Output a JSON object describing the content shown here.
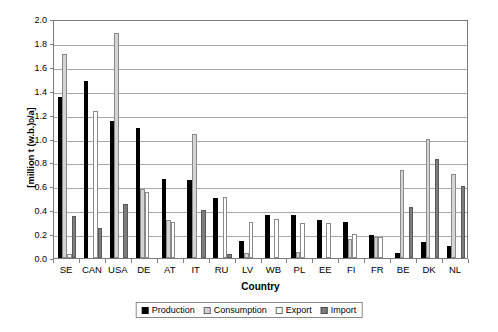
{
  "chart_data": {
    "type": "bar",
    "title": "",
    "xlabel": "Country",
    "ylabel": "[million t (w.b.)_D/a]",
    "ylabel_prefix": "[million t (w.b.)",
    "ylabel_subscript": "D",
    "ylabel_suffix": "/a]",
    "ylim": [
      0.0,
      2.0
    ],
    "ytick_step": 0.2,
    "grid": true,
    "legend_position": "bottom",
    "categories": [
      "SE",
      "CAN",
      "USA",
      "DE",
      "AT",
      "IT",
      "RU",
      "LV",
      "WB",
      "PL",
      "EE",
      "FI",
      "FR",
      "BE",
      "DK",
      "NL"
    ],
    "ytick_labels": [
      "0.0",
      "0.2",
      "0.4",
      "0.6",
      "0.8",
      "1.0",
      "1.2",
      "1.4",
      "1.6",
      "1.8",
      "2.0"
    ],
    "ytick_values": [
      0.0,
      0.2,
      0.4,
      0.6,
      0.8,
      1.0,
      1.2,
      1.4,
      1.6,
      1.8,
      2.0
    ],
    "series": [
      {
        "name": "Production",
        "color": "#000000",
        "values": [
          1.35,
          1.48,
          1.15,
          1.09,
          0.66,
          0.65,
          0.5,
          0.14,
          0.36,
          0.36,
          0.32,
          0.3,
          0.19,
          0.04,
          0.13,
          0.1
        ]
      },
      {
        "name": "Consumption",
        "color": "#d4d4d4",
        "values": [
          1.71,
          0.0,
          1.88,
          0.58,
          0.32,
          1.04,
          0.0,
          0.04,
          0.0,
          0.05,
          0.0,
          0.16,
          0.18,
          0.74,
          1.0,
          0.7
        ]
      },
      {
        "name": "Export",
        "color": "#ffffff",
        "values": [
          0.03,
          1.23,
          0.0,
          0.55,
          0.3,
          0.0,
          0.51,
          0.3,
          0.33,
          0.29,
          0.29,
          0.2,
          0.18,
          0.0,
          0.0,
          0.0
        ]
      },
      {
        "name": "Import",
        "color": "#7d7d7d",
        "values": [
          0.35,
          0.25,
          0.45,
          0.0,
          0.0,
          0.4,
          0.03,
          0.0,
          0.0,
          0.0,
          0.0,
          0.0,
          0.0,
          0.43,
          0.83,
          0.6
        ]
      }
    ]
  },
  "legend": {
    "items": [
      {
        "label": "Production",
        "key": "production"
      },
      {
        "label": "Consumption",
        "key": "consumption"
      },
      {
        "label": "Export",
        "key": "export"
      },
      {
        "label": "Import",
        "key": "import"
      }
    ]
  }
}
